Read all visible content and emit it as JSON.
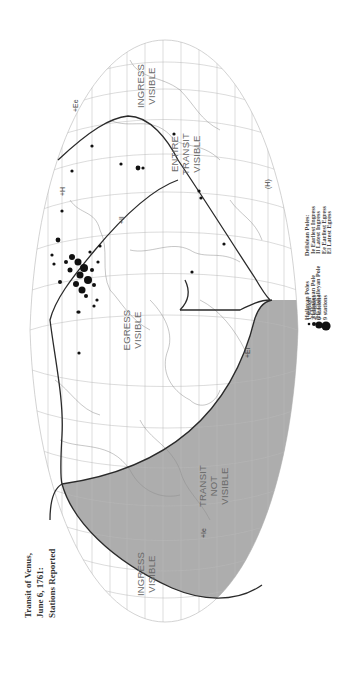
{
  "title": {
    "lines": [
      "Transit of Venus,",
      "June 6, 1761:",
      "Stations Reported"
    ]
  },
  "regions": {
    "ingress_visible_left": [
      "INGRESS",
      "VISIBLE"
    ],
    "ingress_visible_right": [
      "INGRESS",
      "VISIBLE"
    ],
    "transit_not_visible": [
      "TRANSIT",
      "NOT",
      "VISIBLE"
    ],
    "egress_visible": [
      "EGRESS",
      "VISIBLE"
    ],
    "entire_transit_visible": [
      "ENTIRE",
      "TRANSIT",
      "VISIBLE"
    ]
  },
  "pole_markers": {
    "earliest_egress": "+Ee",
    "latest_egress": "+El",
    "latest_ingress": "+Il",
    "earliest_ingress": "+Ie",
    "halleyan": "+H",
    "cishalleyan": "(H)"
  },
  "legend_stations": {
    "items": [
      {
        "label": "1 station",
        "size": 1.3
      },
      {
        "label": "2 stations",
        "size": 2.0
      },
      {
        "label": "6 stations",
        "size": 3.6
      },
      {
        "label": "9 stations",
        "size": 4.6
      }
    ]
  },
  "legend_halleyan": {
    "heading": "Halleyan Poles",
    "items": [
      "H  Halleyan Pole",
      "(H) Cishalleyan Pole"
    ]
  },
  "legend_delislean": {
    "heading": "Delislean Poles:",
    "items": [
      "Ie  Earliest Ingress",
      "Il  Latest Ingress",
      "Ee  Earliest Egress",
      "El  Latest Egress"
    ]
  },
  "colors": {
    "background": "#ffffff",
    "shade": "#a9a9a9",
    "grid": "#b9b9b9",
    "curve": "#2a2a2a",
    "coast": "#8e8e8e",
    "text": "#6a6a6a"
  }
}
